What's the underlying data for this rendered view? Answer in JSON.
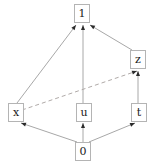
{
  "diagram": {
    "width": 154,
    "height": 164,
    "background_color": "#ffffff",
    "node_fill_color": "#ffffff",
    "node_border_color": "#b4b4b4",
    "node_text_color": "#1a1a1a",
    "edge_color": "#a8a8a8",
    "dashed_edge_color": "#b0aaa8",
    "arrow_color": "#2b2b2b",
    "nodes": [
      {
        "id": "one",
        "label": "1",
        "x": 74,
        "y": 4,
        "w": 16,
        "h": 19
      },
      {
        "id": "z",
        "label": "z",
        "x": 130,
        "y": 50,
        "w": 16,
        "h": 19
      },
      {
        "id": "x",
        "label": "x",
        "x": 8,
        "y": 103,
        "w": 16,
        "h": 19
      },
      {
        "id": "u",
        "label": "u",
        "x": 76,
        "y": 103,
        "w": 16,
        "h": 19
      },
      {
        "id": "t",
        "label": "t",
        "x": 131,
        "y": 103,
        "w": 16,
        "h": 19
      },
      {
        "id": "zero",
        "label": "0",
        "x": 75,
        "y": 142,
        "w": 16,
        "h": 19
      }
    ],
    "edges": [
      {
        "id": "zero-x",
        "from": "0",
        "to": "x",
        "style": "solid",
        "x1": 77,
        "y1": 142,
        "x2": 21,
        "y2": 123
      },
      {
        "id": "zero-u",
        "from": "0",
        "to": "u",
        "style": "solid",
        "x1": 83,
        "y1": 142,
        "x2": 83,
        "y2": 123
      },
      {
        "id": "zero-t",
        "from": "0",
        "to": "t",
        "style": "solid",
        "x1": 89,
        "y1": 142,
        "x2": 135,
        "y2": 123
      },
      {
        "id": "x-one",
        "from": "x",
        "to": "1",
        "style": "solid",
        "x1": 17,
        "y1": 103,
        "x2": 76,
        "y2": 25
      },
      {
        "id": "u-one",
        "from": "u",
        "to": "1",
        "style": "solid",
        "x1": 83,
        "y1": 103,
        "x2": 83,
        "y2": 25
      },
      {
        "id": "t-z",
        "from": "t",
        "to": "z",
        "style": "solid",
        "x1": 138,
        "y1": 103,
        "x2": 138,
        "y2": 71
      },
      {
        "id": "z-one",
        "from": "z",
        "to": "1",
        "style": "solid",
        "x1": 132,
        "y1": 50,
        "x2": 90,
        "y2": 25
      },
      {
        "id": "x-z",
        "from": "x",
        "to": "z",
        "style": "dashed",
        "x1": 22,
        "y1": 110,
        "x2": 137,
        "y2": 71
      }
    ]
  }
}
